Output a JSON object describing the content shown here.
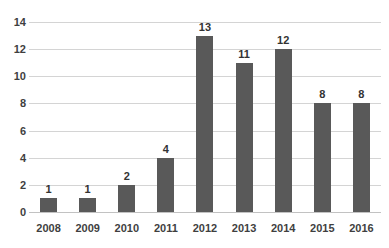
{
  "chart_data": {
    "type": "bar",
    "title": "",
    "subtitle": "",
    "xlabel": "",
    "ylabel": "",
    "categories": [
      "2008",
      "2009",
      "2010",
      "2011",
      "2012",
      "2013",
      "2014",
      "2015",
      "2016"
    ],
    "values": [
      1,
      1,
      2,
      4,
      13,
      11,
      12,
      8,
      8
    ],
    "data_labels": [
      "1",
      "1",
      "2",
      "4",
      "13",
      "11",
      "12",
      "8",
      "8"
    ],
    "ylim": [
      0,
      14
    ],
    "ytick_step": 2,
    "ytick_labels": [
      "0",
      "2",
      "4",
      "6",
      "8",
      "10",
      "12",
      "14"
    ],
    "grid": "horizontal",
    "legend": "none",
    "bar_color": "#595959",
    "gridline_color": "#d4d4d4",
    "axis_text_color": "#3f3f3f",
    "data_label_color": "#333333",
    "background_color": "#ffffff"
  }
}
